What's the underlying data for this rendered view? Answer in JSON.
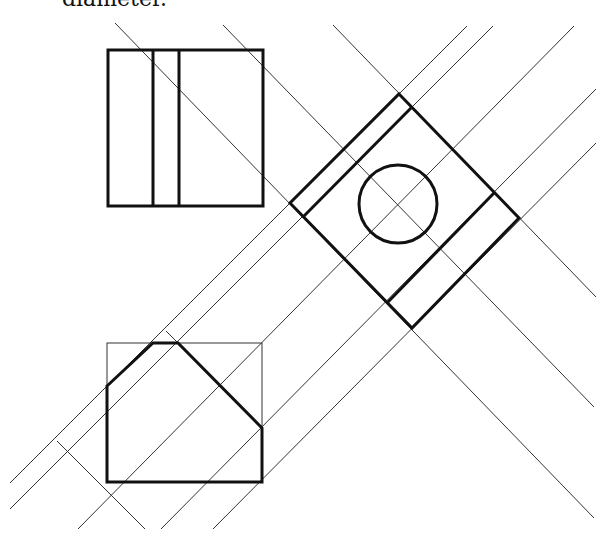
{
  "caption": "diameter.",
  "colors": {
    "stroke": "#111111",
    "background": "#ffffff"
  },
  "views": {
    "front": {
      "name": "front-view",
      "rect": [
        108,
        50,
        263,
        206
      ],
      "inner_verticals": [
        153,
        179
      ]
    },
    "top": {
      "name": "top-view",
      "outline_rect": [
        107,
        343,
        262,
        482
      ],
      "profile": [
        [
          107,
          386
        ],
        [
          153,
          343
        ],
        [
          178,
          343
        ],
        [
          262,
          428
        ],
        [
          262,
          482
        ],
        [
          107,
          482
        ]
      ]
    },
    "auxiliary": {
      "name": "auxiliary-view",
      "outer": [
        [
          399,
          94
        ],
        [
          519,
          218
        ],
        [
          412,
          328
        ],
        [
          290,
          203
        ]
      ],
      "inner_lines": [
        [
          [
            412,
            107
          ],
          [
            303,
            217
          ]
        ],
        [
          [
            494,
            193
          ],
          [
            387,
            303
          ]
        ]
      ],
      "hole": {
        "cx": 398,
        "cy": 204,
        "r": 39
      }
    }
  },
  "projection_lines": [
    [
      [
        467,
        26
      ],
      [
        10,
        483
      ]
    ],
    [
      [
        493,
        26
      ],
      [
        10,
        509
      ]
    ],
    [
      [
        574,
        26
      ],
      [
        78,
        529
      ]
    ],
    [
      [
        596,
        89
      ],
      [
        161,
        529
      ]
    ],
    [
      [
        596,
        143
      ],
      [
        213,
        529
      ]
    ],
    [
      [
        115,
        23
      ],
      [
        594,
        518
      ]
    ],
    [
      [
        223,
        25
      ],
      [
        594,
        407
      ]
    ],
    [
      [
        333,
        25
      ],
      [
        596,
        297
      ]
    ],
    [
      [
        57,
        441
      ],
      [
        145,
        529
      ]
    ],
    [
      [
        166,
        331
      ],
      [
        178,
        343
      ]
    ]
  ]
}
